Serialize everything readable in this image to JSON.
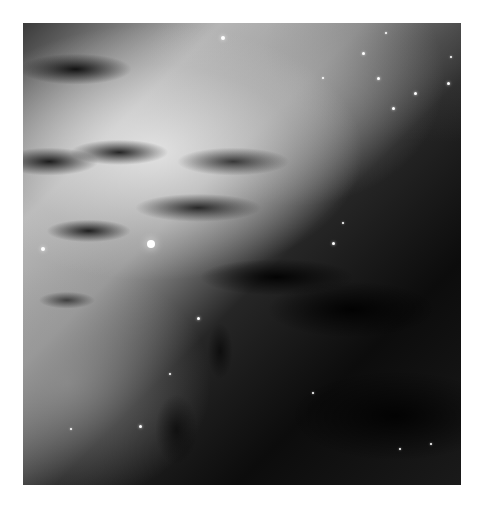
{
  "image": {
    "subject": "grayscale galaxy dust lane with scattered stars",
    "alt": "Black and white telescope image of a galaxy's dark dust lane crossing diagonally with bright star clusters"
  },
  "stars": [
    {
      "x": 128,
      "y": 221,
      "r": 4
    },
    {
      "x": 200,
      "y": 15,
      "r": 2
    },
    {
      "x": 340,
      "y": 30,
      "r": 1.5
    },
    {
      "x": 355,
      "y": 55,
      "r": 1.5
    },
    {
      "x": 363,
      "y": 10,
      "r": 1
    },
    {
      "x": 392,
      "y": 70,
      "r": 1.5
    },
    {
      "x": 428,
      "y": 34,
      "r": 1
    },
    {
      "x": 370,
      "y": 85,
      "r": 1.5
    },
    {
      "x": 300,
      "y": 55,
      "r": 1
    },
    {
      "x": 425,
      "y": 60,
      "r": 1.5
    },
    {
      "x": 320,
      "y": 200,
      "r": 1
    },
    {
      "x": 175,
      "y": 295,
      "r": 1.5
    },
    {
      "x": 20,
      "y": 226,
      "r": 2
    },
    {
      "x": 117,
      "y": 403,
      "r": 1.5
    },
    {
      "x": 48,
      "y": 406,
      "r": 1
    },
    {
      "x": 408,
      "y": 421,
      "r": 1
    },
    {
      "x": 310,
      "y": 220,
      "r": 1.5
    },
    {
      "x": 377,
      "y": 426,
      "r": 1
    },
    {
      "x": 147,
      "y": 351,
      "r": 1
    },
    {
      "x": 290,
      "y": 370,
      "r": 1
    }
  ]
}
